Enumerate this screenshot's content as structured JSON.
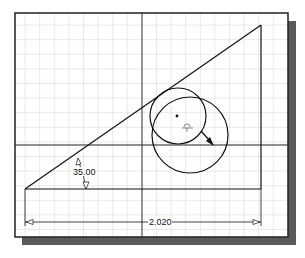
{
  "sketch": {
    "angle_dimension": "35.00",
    "length_dimension": "2.020"
  },
  "colors": {
    "background": "#ffffff",
    "grid": "#c8c8c8",
    "line": "#111111",
    "shadow": "#5a5a5a"
  }
}
